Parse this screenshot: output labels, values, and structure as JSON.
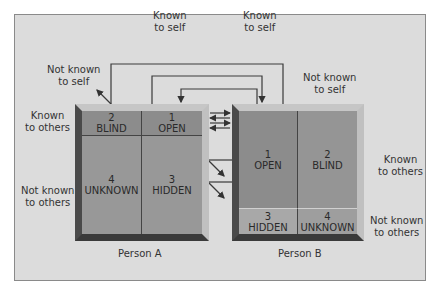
{
  "diagram": {
    "top_labels": {
      "known_to_self_left": "Known\nto self",
      "known_to_self_right": "Known\nto self",
      "not_known_to_self_left": "Not known\nto self",
      "not_known_to_self_right": "Not known\nto self"
    },
    "side_labels": {
      "left_known_to_others": "Known\nto others",
      "left_not_known_to_others": "Not known\nto others",
      "right_known_to_others": "Known\nto others",
      "right_not_known_to_others": "Not known\nto others"
    },
    "person_a": {
      "caption": "Person A",
      "cells": [
        {
          "number": "2",
          "label": "BLIND"
        },
        {
          "number": "1",
          "label": "OPEN"
        },
        {
          "number": "4",
          "label": "UNKNOWN"
        },
        {
          "number": "3",
          "label": "HIDDEN"
        }
      ]
    },
    "person_b": {
      "caption": "Person B",
      "cells": [
        {
          "number": "1",
          "label": "OPEN"
        },
        {
          "number": "2",
          "label": "BLIND"
        },
        {
          "number": "3",
          "label": "HIDDEN"
        },
        {
          "number": "4",
          "label": "UNKNOWN"
        }
      ]
    },
    "colors": {
      "frame_bg": "#dcdcdc",
      "cell_dark": "#8e8e8e",
      "cell_mid": "#9a9a9a",
      "bevel_light": "#c4c4c4",
      "bevel_dark": "#3c3c3c",
      "line": "#333333"
    }
  }
}
